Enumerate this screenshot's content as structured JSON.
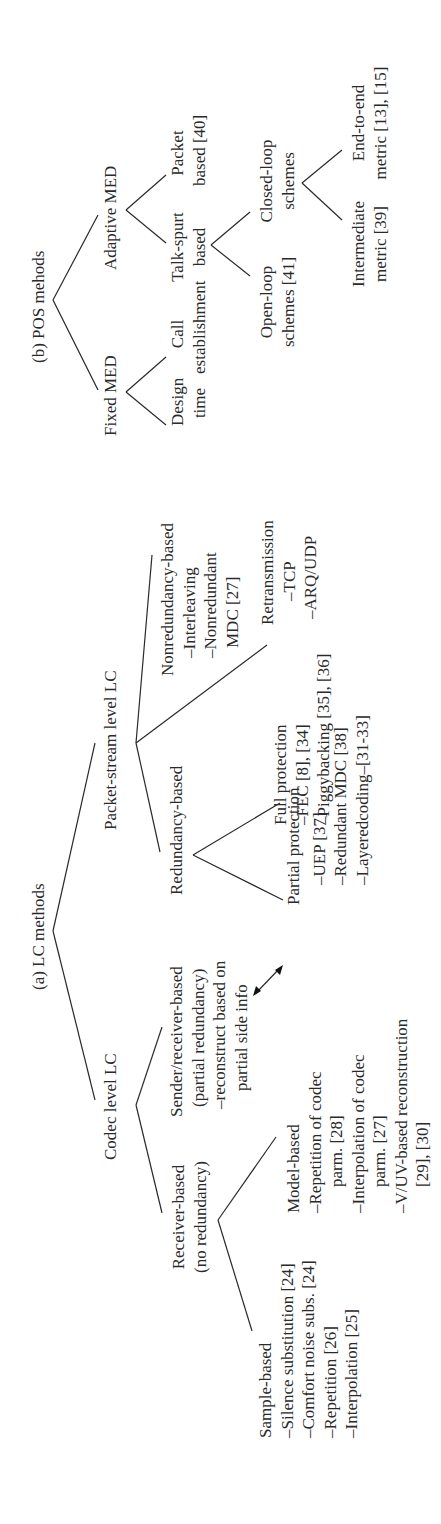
{
  "diagram": {
    "lc": {
      "title": "(a) LC methods",
      "codec": {
        "label": "Codec level LC",
        "receiver": {
          "lines": [
            "Receiver-based",
            "(no redundancy)"
          ],
          "sample": {
            "lines": [
              "Sample-based",
              "–Silence substitution [24]",
              "–Comfort noise subs. [24]",
              "–Repetition [26]",
              "–Interpolation [25]"
            ]
          },
          "model": {
            "lines": [
              "Model-based",
              "–Repetition of codec",
              "parm. [28]",
              "–Interpolation of codec",
              "parm. [27]",
              "–V/UV-based reconstruction",
              "[29], [30]"
            ]
          }
        },
        "sender_receiver": {
          "lines": [
            "Sender/receiver-based",
            "(partial redundancy)",
            "–reconstruct based on",
            "partial side info"
          ]
        }
      },
      "packet": {
        "label": "Packet-stream level LC",
        "redundancy": {
          "label": "Redundancy-based",
          "partial": {
            "lines": [
              "Partial protection",
              "–UEP [37]",
              "–Redundant MDC [38]",
              "–Layeredcoding–[31-33]"
            ]
          },
          "full": {
            "lines": [
              "Full protection",
              "–FEC [8], [34]",
              "–Piggybacking [35], [36]"
            ]
          }
        },
        "nonredundancy": {
          "lines": [
            "Nonredundancy-based",
            "–Interleaving",
            "–Nonredundant",
            "MDC [27]"
          ]
        },
        "retransmission": {
          "lines": [
            "Retransmission",
            "–TCP",
            "–ARQ/UDP"
          ]
        }
      },
      "arrow": "double-arrow-icon"
    },
    "pos": {
      "title": "(b) POS mehods",
      "fixed": {
        "label": "Fixed MED",
        "design": [
          "Design",
          "time"
        ],
        "call": [
          "Call",
          "establishment"
        ]
      },
      "adaptive": {
        "label": "Adaptive MED",
        "talkspurt": [
          "Talk-spurt",
          "based"
        ],
        "packet": [
          "Packet",
          "based [40]"
        ],
        "open_loop": [
          "Open-loop",
          "schemes [41]"
        ],
        "closed_loop": [
          "Closed-loop",
          "schemes"
        ],
        "intermediate": [
          "Intermediate",
          "metric [39]"
        ],
        "end_to_end": [
          "End-to-end",
          "metric [13], [15]"
        ]
      }
    },
    "colors": {
      "ink": "#2a2a2a",
      "background": "#ffffff"
    }
  }
}
